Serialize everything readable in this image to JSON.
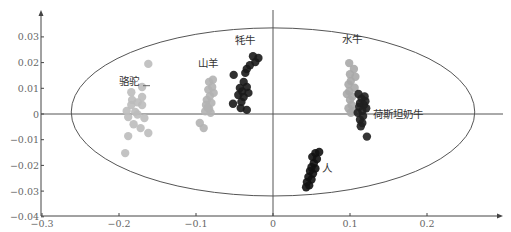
{
  "chart_data": {
    "type": "scatter",
    "title": "",
    "xlabel": "",
    "ylabel": "",
    "xlim": [
      -0.3,
      0.28
    ],
    "ylim": [
      -0.04,
      0.04
    ],
    "x_ticks": [
      -0.3,
      -0.2,
      -0.1,
      0,
      0.1,
      0.2
    ],
    "x_tick_labels": [
      "-0.3",
      "-0.2",
      "-0.1",
      "0",
      "0.1",
      "0.2"
    ],
    "y_ticks": [
      0.03,
      0.02,
      0.01,
      0,
      -0.01,
      -0.02,
      -0.03,
      -0.04
    ],
    "y_tick_labels": [
      "0.03",
      "0.02",
      "0.01",
      "0",
      "-0.01",
      "-0.02",
      "-0.03",
      "-0.04"
    ],
    "grid": false,
    "legend": "none (direct labels)",
    "confidence_ellipse": {
      "cx": 0.0,
      "cy": 0.0008,
      "rx": 0.262,
      "ry": 0.0327
    },
    "series": [
      {
        "name": "骆驼",
        "color": "#bdbdbd",
        "label_pos": [
          -0.2,
          0.0114
        ],
        "points": [
          [
            -0.162,
            0.0195
          ],
          [
            -0.17,
            0.0105
          ],
          [
            -0.184,
            0.0085
          ],
          [
            -0.17,
            0.0066
          ],
          [
            -0.184,
            0.0035
          ],
          [
            -0.17,
            0.0035
          ],
          [
            -0.179,
            0.0008
          ],
          [
            -0.188,
            -0.0012
          ],
          [
            -0.176,
            -0.0002
          ],
          [
            -0.167,
            -0.0016
          ],
          [
            -0.181,
            -0.004
          ],
          [
            -0.172,
            -0.0055
          ],
          [
            -0.162,
            -0.0074
          ],
          [
            -0.188,
            -0.0086
          ],
          [
            -0.192,
            -0.0152
          ],
          [
            -0.183,
            0.0055
          ],
          [
            -0.176,
            0.0045
          ],
          [
            -0.19,
            0.0012
          ]
        ]
      },
      {
        "name": "山羊",
        "color": "#b3b3b3",
        "label_pos": [
          -0.097,
          0.0183
        ],
        "points": [
          [
            -0.078,
            0.0133
          ],
          [
            -0.083,
            0.0125
          ],
          [
            -0.077,
            0.0082
          ],
          [
            -0.082,
            0.007
          ],
          [
            -0.086,
            0.0055
          ],
          [
            -0.08,
            0.0043
          ],
          [
            -0.087,
            0.0035
          ],
          [
            -0.083,
            0.002
          ],
          [
            -0.088,
            0.001
          ],
          [
            -0.081,
            0.0005
          ],
          [
            -0.095,
            -0.0035
          ],
          [
            -0.09,
            -0.0055
          ],
          [
            -0.084,
            0.0095
          ],
          [
            -0.079,
            0.0105
          ],
          [
            -0.085,
            0.0025
          ]
        ]
      },
      {
        "name": "牦牛",
        "color": "#1a1a1a",
        "label_pos": [
          -0.05,
          0.0272
        ],
        "points": [
          [
            -0.026,
            0.0225
          ],
          [
            -0.019,
            0.0218
          ],
          [
            -0.023,
            0.0202
          ],
          [
            -0.03,
            0.019
          ],
          [
            -0.051,
            0.0152
          ],
          [
            -0.034,
            0.0175
          ],
          [
            -0.036,
            0.016
          ],
          [
            -0.038,
            0.0125
          ],
          [
            -0.043,
            0.0101
          ],
          [
            -0.034,
            0.0105
          ],
          [
            -0.045,
            0.0074
          ],
          [
            -0.038,
            0.0066
          ],
          [
            -0.041,
            0.0047
          ],
          [
            -0.052,
            0.004
          ],
          [
            -0.042,
            0.0023
          ],
          [
            -0.034,
            0.0016
          ],
          [
            -0.04,
            0.0088
          ],
          [
            -0.032,
            0.0082
          ]
        ]
      },
      {
        "name": "水牛",
        "color": "#a8a8a8",
        "label_pos": [
          0.09,
          0.0276
        ],
        "points": [
          [
            0.099,
            0.0198
          ],
          [
            0.105,
            0.0175
          ],
          [
            0.1,
            0.0155
          ],
          [
            0.107,
            0.0145
          ],
          [
            0.101,
            0.0128
          ],
          [
            0.098,
            0.0115
          ],
          [
            0.106,
            0.0102
          ],
          [
            0.099,
            0.0088
          ],
          [
            0.096,
            0.0078
          ],
          [
            0.103,
            0.0068
          ],
          [
            0.1,
            0.0055
          ],
          [
            0.102,
            0.0035
          ],
          [
            0.098,
            0.0022
          ],
          [
            0.104,
            0.0012
          ],
          [
            0.101,
            0.0005
          ]
        ]
      },
      {
        "name": "荷斯坦奶牛",
        "color": "#1f1f1f",
        "label_pos": [
          0.13,
          -0.0016
        ],
        "points": [
          [
            0.111,
            0.0078
          ],
          [
            0.119,
            0.0068
          ],
          [
            0.115,
            0.006
          ],
          [
            0.12,
            0.005
          ],
          [
            0.113,
            0.0042
          ],
          [
            0.118,
            0.0035
          ],
          [
            0.112,
            0.0028
          ],
          [
            0.121,
            0.0022
          ],
          [
            0.116,
            0.0012
          ],
          [
            0.11,
            0.0005
          ],
          [
            0.117,
            -0.0008
          ],
          [
            0.113,
            -0.0022
          ],
          [
            0.116,
            -0.0035
          ],
          [
            0.114,
            -0.0048
          ],
          [
            0.122,
            -0.0088
          ]
        ]
      },
      {
        "name": "人",
        "color": "#111111",
        "label_pos": [
          0.064,
          -0.0226
        ],
        "points": [
          [
            0.055,
            -0.0152
          ],
          [
            0.06,
            -0.0148
          ],
          [
            0.051,
            -0.0167
          ],
          [
            0.057,
            -0.0175
          ],
          [
            0.053,
            -0.0192
          ],
          [
            0.05,
            -0.0207
          ],
          [
            0.055,
            -0.0212
          ],
          [
            0.048,
            -0.0222
          ],
          [
            0.052,
            -0.0232
          ],
          [
            0.046,
            -0.0245
          ],
          [
            0.05,
            -0.0255
          ],
          [
            0.044,
            -0.0265
          ],
          [
            0.047,
            -0.0278
          ],
          [
            0.043,
            -0.0285
          ]
        ]
      }
    ]
  }
}
